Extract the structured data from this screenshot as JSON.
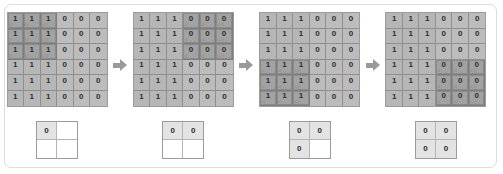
{
  "figure": {
    "colors": {
      "frame_border": "#dcdcdc",
      "cell_one": "#b6b6b6",
      "cell_zero": "#bcbcbc",
      "cell_kernel": "#a2a2a2",
      "grid_line": "#8f8f8f",
      "arrow": "#9a9a9a",
      "output_filled": "#e3e3e3",
      "output_empty": "#ffffff",
      "text": "#2e2e2e",
      "subscript_text": "#8a8a8a"
    },
    "arrow_icon": "arrow-right-icon",
    "input_rows": 6,
    "input_cols": 6,
    "output_rows": 2,
    "output_cols": 2,
    "kernel_size": 3
  },
  "steps": [
    {
      "name": "step-1",
      "kernel_row_start": 0,
      "kernel_col_start": 0,
      "input": [
        [
          "1",
          "1",
          "1",
          "0",
          "0",
          "0"
        ],
        [
          "1",
          "1",
          "1",
          "0",
          "0",
          "0"
        ],
        [
          "1",
          "1",
          "1",
          "0",
          "0",
          "0"
        ],
        [
          "1",
          "1",
          "1",
          "0",
          "0",
          "0"
        ],
        [
          "1",
          "1",
          "1",
          "0",
          "0",
          "0"
        ],
        [
          "1",
          "1",
          "1",
          "0",
          "0",
          "0"
        ]
      ],
      "kernel_weights": [
        [
          "x1",
          "x0",
          "x(-1)"
        ],
        [
          "x1",
          "x0",
          "x(-1)"
        ],
        [
          "x1",
          "x0",
          "x(-1)"
        ]
      ],
      "output": [
        [
          "0",
          ""
        ],
        [
          "",
          ""
        ]
      ]
    },
    {
      "name": "step-2",
      "kernel_row_start": 0,
      "kernel_col_start": 3,
      "input": [
        [
          "1",
          "1",
          "1",
          "0",
          "0",
          "0"
        ],
        [
          "1",
          "1",
          "1",
          "0",
          "0",
          "0"
        ],
        [
          "1",
          "1",
          "1",
          "0",
          "0",
          "0"
        ],
        [
          "1",
          "1",
          "1",
          "0",
          "0",
          "0"
        ],
        [
          "1",
          "1",
          "1",
          "0",
          "0",
          "0"
        ],
        [
          "1",
          "1",
          "1",
          "0",
          "0",
          "0"
        ]
      ],
      "kernel_weights": [
        [
          "x1",
          "x0",
          "x(-1)"
        ],
        [
          "x1",
          "x0",
          "x(-1)"
        ],
        [
          "x1",
          "x0",
          "x(-1)"
        ]
      ],
      "output": [
        [
          "0",
          "0"
        ],
        [
          "",
          ""
        ]
      ]
    },
    {
      "name": "step-3",
      "kernel_row_start": 3,
      "kernel_col_start": 0,
      "input": [
        [
          "1",
          "1",
          "1",
          "0",
          "0",
          "0"
        ],
        [
          "1",
          "1",
          "1",
          "0",
          "0",
          "0"
        ],
        [
          "1",
          "1",
          "1",
          "0",
          "0",
          "0"
        ],
        [
          "1",
          "1",
          "1",
          "0",
          "0",
          "0"
        ],
        [
          "1",
          "1",
          "1",
          "0",
          "0",
          "0"
        ],
        [
          "1",
          "1",
          "1",
          "0",
          "0",
          "0"
        ]
      ],
      "kernel_weights": [
        [
          "x1",
          "x0",
          "x(-1)"
        ],
        [
          "x1",
          "x0",
          "x(-1)"
        ],
        [
          "x1",
          "x0",
          "x(-1)"
        ]
      ],
      "output": [
        [
          "0",
          "0"
        ],
        [
          "0",
          ""
        ]
      ]
    },
    {
      "name": "step-4",
      "kernel_row_start": 3,
      "kernel_col_start": 3,
      "input": [
        [
          "1",
          "1",
          "1",
          "0",
          "0",
          "0"
        ],
        [
          "1",
          "1",
          "1",
          "0",
          "0",
          "0"
        ],
        [
          "1",
          "1",
          "1",
          "0",
          "0",
          "0"
        ],
        [
          "1",
          "1",
          "1",
          "0",
          "0",
          "0"
        ],
        [
          "1",
          "1",
          "1",
          "0",
          "0",
          "0"
        ],
        [
          "1",
          "1",
          "1",
          "0",
          "0",
          "0"
        ]
      ],
      "kernel_weights": [
        [
          "x1",
          "x0",
          "x(-1)"
        ],
        [
          "x1",
          "x0",
          "x(-1)"
        ],
        [
          "x1",
          "x0",
          "x(-1)"
        ]
      ],
      "output": [
        [
          "0",
          "0"
        ],
        [
          "0",
          "0"
        ]
      ]
    }
  ]
}
